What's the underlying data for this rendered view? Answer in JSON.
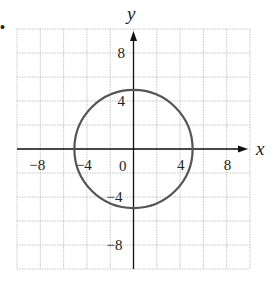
{
  "chart_data": {
    "type": "line",
    "title": "",
    "xlabel": "x",
    "ylabel": "y",
    "xlim": [
      -10,
      10
    ],
    "ylim": [
      -10,
      10
    ],
    "grid": true,
    "grid_step": 2,
    "x_ticks": [
      {
        "value": -8,
        "label": "−8"
      },
      {
        "value": -4,
        "label": "−4"
      },
      {
        "value": 4,
        "label": "4"
      },
      {
        "value": 8,
        "label": "8"
      }
    ],
    "y_ticks": [
      {
        "value": 8,
        "label": "8"
      },
      {
        "value": 4,
        "label": "4"
      },
      {
        "value": -4,
        "label": "−4"
      },
      {
        "value": -8,
        "label": "−8"
      }
    ],
    "origin_label": "0",
    "series": [
      {
        "name": "circle",
        "shape": "circle",
        "center": [
          0,
          0
        ],
        "radius": 5,
        "equation": "x^2 + y^2 = 25",
        "color": "#555555"
      }
    ],
    "legend": null,
    "bullet": "•"
  },
  "colors": {
    "axis": "#111111",
    "grid": "#b8b8b8",
    "curve": "#555555",
    "text": "#222222"
  }
}
